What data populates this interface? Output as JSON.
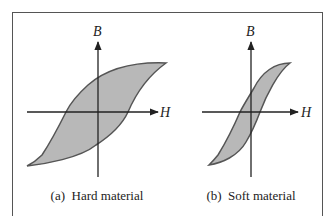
{
  "figure": {
    "panels": [
      {
        "id": "a",
        "caption": "(a)  Hard material",
        "y_axis_label": "B",
        "x_axis_label": "H"
      },
      {
        "id": "b",
        "caption": "(b)  Soft material",
        "y_axis_label": "B",
        "x_axis_label": "H"
      }
    ],
    "colors": {
      "loop_fill": "#b8b8b8",
      "loop_stroke": "#555555",
      "axis": "#222222",
      "frame": "#555555"
    }
  }
}
